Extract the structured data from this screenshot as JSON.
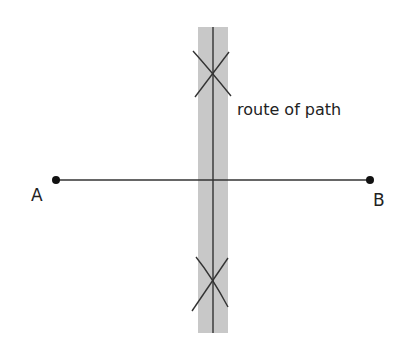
{
  "diagram": {
    "point_a_label": "A",
    "point_b_label": "B",
    "route_label": "route of path",
    "colors": {
      "band": "#c8c8c8",
      "line": "#333333",
      "point": "#111111"
    }
  }
}
